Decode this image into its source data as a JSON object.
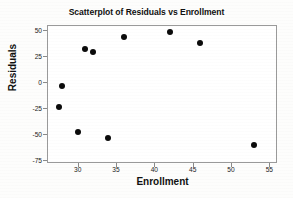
{
  "chart_data": {
    "type": "scatter",
    "title": "Scatterplot of Residuals vs Enrollment",
    "xlabel": "Enrollment",
    "ylabel": "Residuals",
    "xlim": [
      26,
      56
    ],
    "ylim": [
      -78,
      55
    ],
    "grid": false,
    "legend": null,
    "xticks": [
      30,
      35,
      40,
      45,
      50,
      55
    ],
    "yticks": [
      50,
      25,
      0,
      -25,
      -50,
      -75
    ],
    "xtick_labels": [
      "30",
      "35",
      "40",
      "45",
      "50",
      "55"
    ],
    "ytick_labels": [
      "50",
      "25",
      "0",
      "-25",
      "-50",
      "-75"
    ],
    "marker": {
      "shape": "circle",
      "color": "#0b0b0b",
      "size": 6
    },
    "points": [
      {
        "x": 27.5,
        "y": -24
      },
      {
        "x": 28,
        "y": -4
      },
      {
        "x": 30,
        "y": -48
      },
      {
        "x": 31,
        "y": 32
      },
      {
        "x": 32,
        "y": 29
      },
      {
        "x": 34,
        "y": -54
      },
      {
        "x": 36,
        "y": 43
      },
      {
        "x": 42,
        "y": 48
      },
      {
        "x": 46,
        "y": 38
      },
      {
        "x": 53,
        "y": -61
      }
    ],
    "x": [
      27.5,
      28,
      30,
      31,
      32,
      34,
      36,
      42,
      46,
      53
    ],
    "values": [
      -24,
      -4,
      -48,
      32,
      29,
      -54,
      43,
      48,
      38,
      -61
    ]
  }
}
